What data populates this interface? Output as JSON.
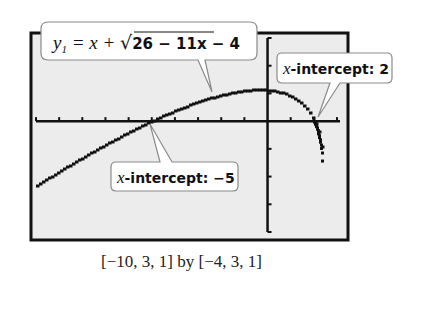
{
  "chart_data": {
    "type": "line",
    "title": "",
    "function_label": {
      "lhs": "y",
      "subscript": "1",
      "rhs_prefix": " = x + ",
      "radicand": "26 − 11x",
      "rhs_suffix": " − 4"
    },
    "equation": "y1 = x + sqrt(26 - 11x) - 4",
    "window": {
      "xmin": -10,
      "xmax": 3,
      "xscl": 1,
      "ymin": -4,
      "ymax": 3,
      "yscl": 1
    },
    "caption": "[−10, 3, 1] by [−4, 3, 1]",
    "annotations": [
      {
        "label_var": "x",
        "label_text": "-intercept: 2",
        "x": 2,
        "y": 0
      },
      {
        "label_var": "x",
        "label_text": "-intercept: −5",
        "x": -5,
        "y": 0
      }
    ],
    "series": [
      {
        "name": "y1",
        "x": [
          -10,
          -9,
          -8,
          -7,
          -6,
          -5,
          -4,
          -3,
          -2,
          -1,
          0,
          1,
          1.5,
          2,
          2.2,
          2.364
        ],
        "values": [
          -2.34,
          -1.44,
          -0.56,
          0.32,
          1.18,
          0,
          0,
          0,
          0,
          0,
          0,
          0,
          0,
          0,
          0,
          0
        ]
      }
    ],
    "computed_points": [
      [
        -10,
        -2.34
      ],
      [
        -9,
        -2.0
      ],
      [
        -8,
        -1.63
      ],
      [
        -7,
        -1.27
      ],
      [
        -6,
        -0.9
      ],
      [
        -5,
        0.0
      ],
      [
        -4,
        0.83
      ],
      [
        -3,
        0.36
      ],
      [
        -2,
        0.93
      ],
      [
        -1,
        1.08
      ],
      [
        0,
        1.1
      ],
      [
        1,
        0.87
      ],
      [
        1.5,
        0.53
      ],
      [
        2,
        0.0
      ],
      [
        2.2,
        -0.54
      ],
      [
        2.364,
        -1.64
      ]
    ],
    "xlabel": "",
    "ylabel": "",
    "grid": false,
    "colors": {
      "screen_bg": "#ececec",
      "frame": "#111111",
      "curve": "#111111",
      "callout_bg": "#ffffff",
      "callout_border": "#888888"
    }
  }
}
